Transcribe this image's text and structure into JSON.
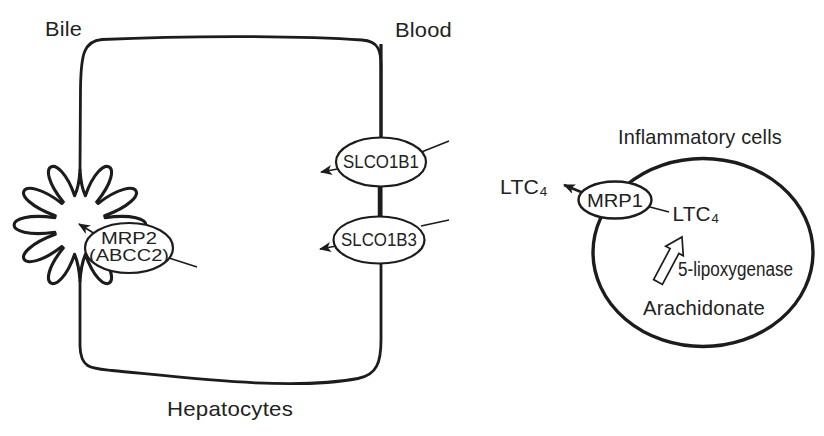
{
  "hepatocyte_panel": {
    "bile_label": "Bile",
    "blood_label": "Blood",
    "cell_label": "Hepatocytes",
    "transporters": {
      "canalicular_line1": "MRP2",
      "canalicular_line2": "(ABCC2)",
      "sinusoidal_upper": "SLCO1B1",
      "sinusoidal_lower": "SLCO1B3"
    }
  },
  "inflammatory_panel": {
    "title": "Inflammatory cells",
    "exporter": "MRP1",
    "ltc4_outside": "LTC₄",
    "ltc4_inside": "LTC₄",
    "enzyme": "5-lipoxygenase",
    "substrate": "Arachidonate"
  },
  "colors": {
    "line": "#1c1c1c",
    "text": "#222222",
    "background": "#ffffff"
  }
}
